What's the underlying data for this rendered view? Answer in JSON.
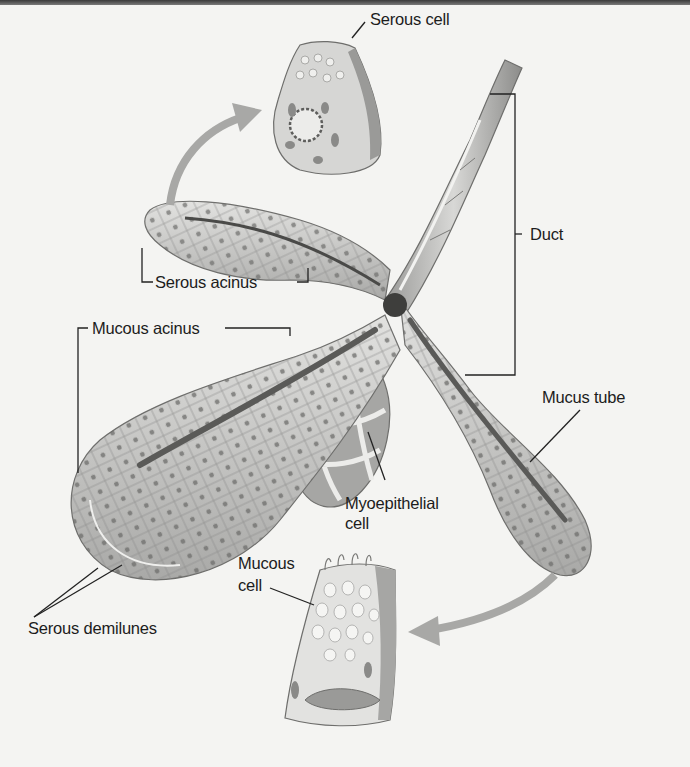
{
  "figure": {
    "colors": {
      "background": "#f4f4f2",
      "tissue_light": "#dcdcda",
      "tissue_mid": "#b9b9b7",
      "tissue_dark": "#6e6e6c",
      "lumen": "#4a4a48",
      "arrow": "#a8a8a6",
      "text": "#1c1c1c",
      "leader": "#222222"
    },
    "labels": {
      "serous_cell": "Serous cell",
      "duct": "Duct",
      "serous_acinus": "Serous acinus",
      "mucous_acinus": "Mucous acinus",
      "mucus_tube": "Mucus tube",
      "myoepithelial_line1": "Myoepithelial",
      "myoepithelial_line2": "cell",
      "mucous_cell_line1": "Mucous",
      "mucous_cell_line2": "cell",
      "serous_demilunes": "Serous demilunes"
    }
  }
}
